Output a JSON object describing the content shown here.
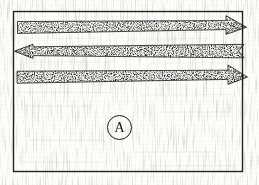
{
  "figure": {
    "kind": "scanned-line-drawing",
    "caption_label": "A",
    "background_color": "#fdfdfc",
    "ink_color": "#1b1b1b",
    "stipple_color": "#2a2a2a",
    "width": 259,
    "height": 185,
    "frame": {
      "name": "border-rectangle",
      "x": 13,
      "y": 11,
      "width": 230,
      "height": 161,
      "stroke": "#232323",
      "stroke_width": 1.4
    },
    "arrows": [
      {
        "id": "arrow-1",
        "direction": "right",
        "tail_style": "flat",
        "head_style": "solid-triangle",
        "fill": "stipple",
        "x_start": 17,
        "x_end": 246,
        "y_center": 27,
        "thickness": 13
      },
      {
        "id": "arrow-2",
        "direction": "left",
        "tail_style": "notched-chevron",
        "head_style": "solid-triangle",
        "fill": "stipple",
        "x_start": 14,
        "x_end": 244,
        "y_center": 51,
        "thickness": 13
      },
      {
        "id": "arrow-3",
        "direction": "right",
        "tail_style": "flat",
        "head_style": "solid-triangle",
        "fill": "stipple",
        "x_start": 17,
        "x_end": 247,
        "y_center": 77,
        "thickness": 13
      }
    ],
    "label": {
      "name": "circled-letter-a",
      "text": "A",
      "center_x": 118,
      "center_y": 126,
      "diameter": 23
    }
  }
}
